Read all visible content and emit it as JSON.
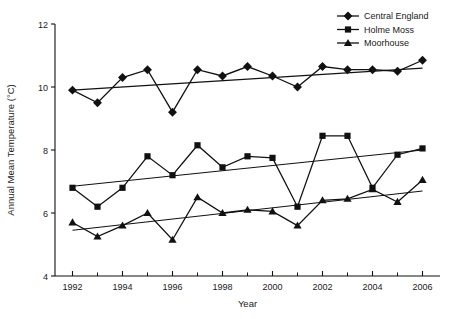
{
  "chart_data": {
    "type": "line",
    "title": "",
    "xlabel": "Year",
    "ylabel": "Annual Mean Temperature (°C)",
    "xlim": [
      1991.3,
      2006.7
    ],
    "ylim": [
      4,
      12
    ],
    "yticks": [
      4,
      6,
      8,
      10,
      12
    ],
    "ytick_labels": [
      "4",
      "6",
      "8",
      "10",
      "12"
    ],
    "xticks": [
      1992,
      1994,
      1996,
      1998,
      2000,
      2002,
      2004,
      2006
    ],
    "xtick_labels": [
      "1992",
      "1994",
      "1996",
      "1998",
      "2000",
      "2002",
      "2004",
      "2006"
    ],
    "x_minor_ticks": [
      1993,
      1995,
      1997,
      1999,
      2001,
      2003,
      2005
    ],
    "grid": false,
    "legend_position": "top-right",
    "line_color": "#111111",
    "x": [
      1992,
      1993,
      1994,
      1995,
      1996,
      1997,
      1998,
      1999,
      2000,
      2001,
      2002,
      2003,
      2004,
      2005,
      2006
    ],
    "series": [
      {
        "name": "Central England",
        "marker": "diamond",
        "values": [
          9.9,
          9.5,
          10.3,
          10.55,
          9.2,
          10.55,
          10.35,
          10.65,
          10.35,
          10.0,
          10.65,
          10.55,
          10.55,
          10.5,
          10.85
        ],
        "trend": {
          "start_value": 9.9,
          "end_value": 10.6,
          "type": "linear-fit"
        }
      },
      {
        "name": "Holme Moss",
        "marker": "square",
        "values": [
          6.8,
          6.2,
          6.8,
          7.8,
          7.2,
          8.15,
          7.45,
          7.8,
          7.75,
          6.2,
          8.45,
          8.45,
          6.8,
          7.85,
          8.05
        ],
        "trend": {
          "start_value": 6.85,
          "end_value": 8.0,
          "type": "linear-fit"
        }
      },
      {
        "name": "Moorhouse",
        "marker": "triangle",
        "values": [
          5.7,
          5.25,
          5.6,
          6.0,
          5.15,
          6.5,
          6.0,
          6.1,
          6.05,
          5.6,
          6.4,
          6.45,
          6.75,
          6.35,
          7.05
        ],
        "trend": {
          "start_value": 5.45,
          "end_value": 6.7,
          "type": "linear-fit"
        }
      }
    ]
  },
  "legend": {
    "items": [
      {
        "label": "Central England",
        "marker": "diamond"
      },
      {
        "label": "Holme Moss",
        "marker": "square"
      },
      {
        "label": "Moorhouse",
        "marker": "triangle"
      }
    ]
  }
}
